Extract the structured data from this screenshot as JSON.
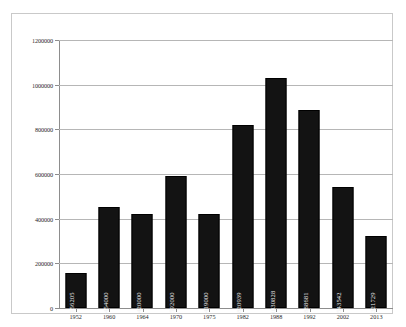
{
  "chart_data": {
    "type": "bar",
    "title": "",
    "subtitle": "",
    "xlabel": "",
    "ylabel": "",
    "categories": [
      "1952",
      "1960",
      "1964",
      "1970",
      "1975",
      "1982",
      "1988",
      "1992",
      "2002",
      "2013"
    ],
    "values": [
      156205,
      454000,
      420000,
      592000,
      419000,
      820939,
      1030828,
      888681,
      543542,
      321729
    ],
    "data_labels": [
      "156205",
      "454000",
      "420000",
      "592000",
      "419000",
      "820939",
      "1030828",
      "888681",
      "543542",
      "321729"
    ],
    "ylim": [
      0,
      1200000
    ],
    "ytick_labels": [
      "0",
      "200000",
      "400000",
      "600000",
      "800000",
      "1000000",
      "1200000"
    ],
    "ytick_values": [
      0,
      200000,
      400000,
      600000,
      800000,
      1000000,
      1200000
    ],
    "grid": true,
    "grid_axis": "y",
    "legend": false,
    "legend_position": "none",
    "bar_color": "#131313",
    "data_label_color": "#f2f2f2",
    "data_label_rotation": 90,
    "gridline_color": "#b6b6b6",
    "axis_color": "#8d8d8d",
    "background_color": "#ffffff",
    "border_color": "#c9c9c9"
  }
}
